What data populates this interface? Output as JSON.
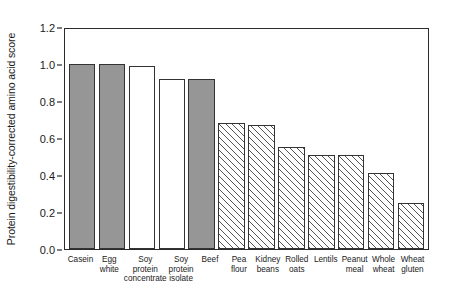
{
  "chart_data": {
    "type": "bar",
    "title": "",
    "xlabel": "",
    "ylabel": "Protein digestibility-corrected amino acid score",
    "ylim": [
      0.0,
      1.2
    ],
    "yticks": [
      "0.0",
      "0.2",
      "0.4",
      "0.6",
      "0.8",
      "1.0",
      "1.2"
    ],
    "ytick_values": [
      0.0,
      0.2,
      0.4,
      0.6,
      0.8,
      1.0,
      1.2
    ],
    "grid": false,
    "legend": "none",
    "categories": [
      "Casein",
      "Egg white",
      "Soy protein concentrate",
      "Soy protein isolate",
      "Beef",
      "Pea flour",
      "Kidney beans",
      "Rolled oats",
      "Lentils",
      "Peanut meal",
      "Whole wheat",
      "Wheat gluten"
    ],
    "category_lines": [
      [
        "Casein"
      ],
      [
        "Egg",
        "white"
      ],
      [
        "Soy",
        "protein",
        "concentrate"
      ],
      [
        "Soy",
        "protein",
        "isolate"
      ],
      [
        "Beef"
      ],
      [
        "Pea",
        "flour"
      ],
      [
        "Kidney",
        "beans"
      ],
      [
        "Rolled",
        "oats"
      ],
      [
        "Lentils"
      ],
      [
        "Peanut",
        "meal"
      ],
      [
        "Whole",
        "wheat"
      ],
      [
        "Wheat",
        "gluten"
      ]
    ],
    "values": [
      1.0,
      1.0,
      0.99,
      0.92,
      0.92,
      0.68,
      0.67,
      0.55,
      0.51,
      0.51,
      0.41,
      0.25
    ],
    "bar_styles": [
      "solid",
      "solid",
      "open",
      "open",
      "solid",
      "hatch",
      "hatch",
      "hatch",
      "hatch",
      "hatch",
      "hatch",
      "hatch"
    ],
    "colors": {
      "solid_fill": "#969696",
      "open_fill": "#ffffff",
      "hatch_line": "#555555",
      "bar_edge": "#333333",
      "axis": "#2b2b2b",
      "text": "#1a1a1a"
    }
  }
}
